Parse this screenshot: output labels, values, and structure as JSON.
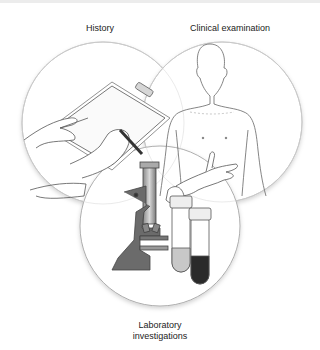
{
  "diagram": {
    "type": "venn",
    "sets": [
      {
        "id": "history",
        "label": "History",
        "illustration": "hands-writing-on-clipboard-icon"
      },
      {
        "id": "clinical",
        "label": "Clinical examination",
        "illustration": "human-torso-with-examining-hand-icon"
      },
      {
        "id": "lab",
        "label": "Laboratory investigations",
        "label_lines": [
          "Laboratory",
          "investigations"
        ],
        "illustration": "microscope-and-test-tubes-icon"
      }
    ],
    "colors": {
      "background": "#ffffff",
      "circle_fill": "#ffffff",
      "circle_stroke": "#9a9a9a",
      "line_art": "#555555",
      "microscope_body": "#6b6b6b",
      "tube_fluid_light": "#c8c8c8",
      "tube_fluid_dark": "#2a2a2a"
    }
  }
}
